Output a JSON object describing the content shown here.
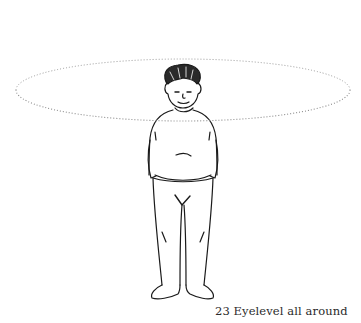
{
  "figure": {
    "number": "23",
    "title": "Eyelevel all around",
    "caption": "23 Eyelevel all around",
    "eyelevel_ellipse": {
      "cx": 183,
      "cy": 90,
      "rx": 167,
      "ry": 31,
      "style": "dotted"
    }
  },
  "colors": {
    "ink": "#1a1a1a",
    "dotted": "#9a9a9a",
    "background": "#ffffff"
  }
}
